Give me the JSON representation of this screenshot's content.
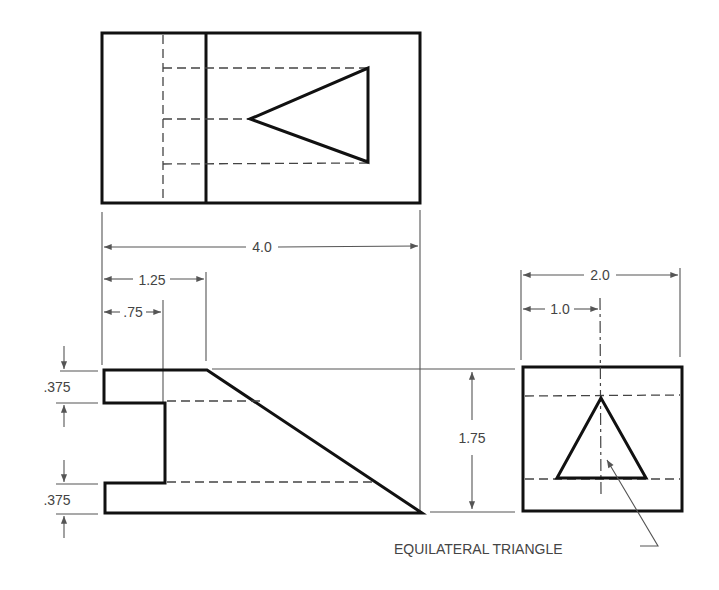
{
  "drawing": {
    "type": "orthographic projection",
    "views": [
      "top",
      "front",
      "right-side"
    ],
    "line_color": "#111111",
    "dimension_color": "#555555"
  },
  "dimensions": {
    "overall_width": "4.0",
    "step_width": "1.25",
    "notch_width": ".75",
    "top_flange": ".375",
    "bottom_flange": ".375",
    "height": "1.75",
    "depth": "2.0",
    "half_depth": "1.0"
  },
  "annotations": {
    "triangle_note": "EQUILATERAL TRIANGLE"
  }
}
